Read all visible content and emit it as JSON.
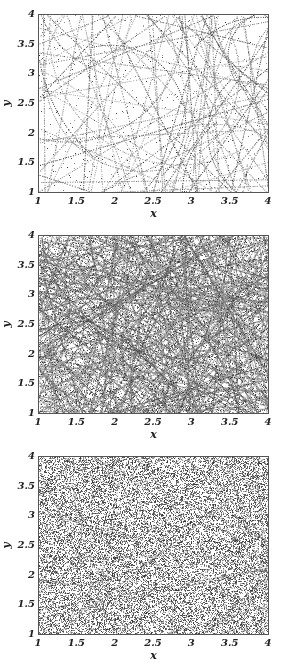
{
  "chart_data": [
    {
      "type": "scatter",
      "title": "",
      "xlabel": "x",
      "ylabel": "y",
      "xlim": [
        1,
        4
      ],
      "ylim": [
        1,
        4
      ],
      "x_ticks": [
        "1",
        "1.5",
        "2",
        "2.5",
        "3",
        "3.5",
        "4"
      ],
      "y_ticks": [
        "1",
        "1.5",
        "2",
        "2.5",
        "3",
        "3.5",
        "4"
      ],
      "grid": false,
      "style": "sparse dotted trajectories (straight segments and arcs)",
      "density": "low"
    },
    {
      "type": "scatter",
      "title": "",
      "xlabel": "x",
      "ylabel": "y",
      "xlim": [
        1,
        4
      ],
      "ylim": [
        1,
        4
      ],
      "x_ticks": [
        "1",
        "1.5",
        "2",
        "2.5",
        "3",
        "3.5",
        "4"
      ],
      "y_ticks": [
        "1",
        "1.5",
        "2",
        "2.5",
        "3",
        "3.5",
        "4"
      ],
      "grid": false,
      "style": "dense dotted trajectories with visible filament structure",
      "density": "medium"
    },
    {
      "type": "scatter",
      "title": "",
      "xlabel": "x",
      "ylabel": "y",
      "xlim": [
        1,
        4
      ],
      "ylim": [
        1,
        4
      ],
      "x_ticks": [
        "1",
        "1.5",
        "2",
        "2.5",
        "3",
        "3.5",
        "4"
      ],
      "y_ticks": [
        "1",
        "1.5",
        "2",
        "2.5",
        "3",
        "3.5",
        "4"
      ],
      "grid": false,
      "style": "nearly uniform random point cloud",
      "density": "high"
    }
  ],
  "colors": {
    "point": "#333333",
    "frame": "#555555",
    "background": "#ffffff"
  }
}
